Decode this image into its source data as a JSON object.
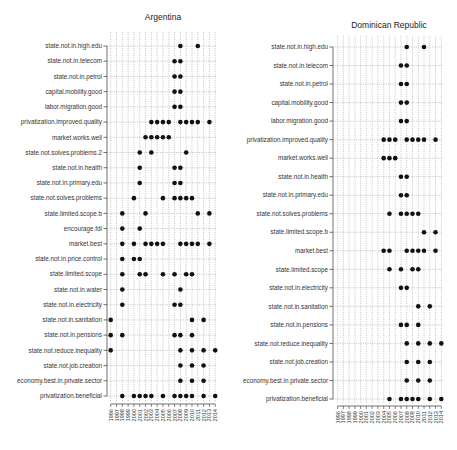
{
  "chart_data": [
    {
      "type": "scatter",
      "title": "Argentina",
      "xlabel": "",
      "ylabel": "",
      "x_ticks": [
        "1996",
        "1997",
        "1998",
        "1999",
        "2000",
        "2001",
        "2002",
        "2003",
        "2004",
        "2005",
        "2006",
        "2007",
        "2008",
        "2009",
        "2010",
        "2011",
        "2012",
        "2013",
        "2014"
      ],
      "xlim": [
        1996,
        2014
      ],
      "grid": true,
      "rows": [
        {
          "label": "state.not.in.high.edu",
          "years": [
            2008,
            2011
          ]
        },
        {
          "label": "state.not.in.telecom",
          "years": [
            2007,
            2008
          ]
        },
        {
          "label": "state.not.in.petrol",
          "years": [
            2007,
            2008
          ]
        },
        {
          "label": "capital.mobility.good",
          "years": [
            2007,
            2008
          ]
        },
        {
          "label": "labor.migration.good",
          "years": [
            2007,
            2008
          ]
        },
        {
          "label": "privatization.improved.quality",
          "years": [
            2003,
            2004,
            2005,
            2006,
            2008,
            2009,
            2010,
            2011,
            2013
          ]
        },
        {
          "label": "market.works.well",
          "years": [
            2002,
            2003,
            2004,
            2005,
            2006
          ]
        },
        {
          "label": "state.not.solves.problems.2",
          "years": [
            2001,
            2003,
            2009
          ]
        },
        {
          "label": "state.not.in.health",
          "years": [
            2001,
            2007,
            2008
          ]
        },
        {
          "label": "state.not.in.primary.edu",
          "years": [
            2001,
            2007,
            2008
          ]
        },
        {
          "label": "state.not.solves.problems",
          "years": [
            2000,
            2005,
            2007,
            2008,
            2009,
            2010
          ]
        },
        {
          "label": "state.limited.scope.b",
          "years": [
            1998,
            2002,
            2011,
            2013
          ]
        },
        {
          "label": "encourage.fdi",
          "years": [
            1998,
            2001
          ]
        },
        {
          "label": "market.best",
          "years": [
            1998,
            2000,
            2002,
            2003,
            2004,
            2005,
            2008,
            2009,
            2010,
            2011,
            2013
          ]
        },
        {
          "label": "state.not.in.price.control",
          "years": [
            1998,
            2000,
            2001
          ]
        },
        {
          "label": "state.limited.scope",
          "years": [
            1998,
            2001,
            2002,
            2005,
            2007,
            2009,
            2010
          ]
        },
        {
          "label": "state.not.in.water",
          "years": [
            1998,
            2008
          ]
        },
        {
          "label": "state.not.in.electricity",
          "years": [
            1998,
            2007,
            2008
          ]
        },
        {
          "label": "state.not.in.sanitation",
          "years": [
            1996,
            2010,
            2012
          ]
        },
        {
          "label": "state.not.in.pensions",
          "years": [
            1996,
            1998,
            2007,
            2008,
            2010
          ]
        },
        {
          "label": "state.not.reduce.inequality",
          "years": [
            1996,
            2008,
            2010,
            2012,
            2014
          ]
        },
        {
          "label": "state.not.job.creation",
          "years": [
            2008,
            2010,
            2012
          ]
        },
        {
          "label": "economy.best.in.private.sector",
          "years": [
            2008,
            2010,
            2012
          ]
        },
        {
          "label": "privatization.beneficial",
          "years": [
            1998,
            2000,
            2001,
            2002,
            2003,
            2005,
            2007,
            2008,
            2009,
            2010,
            2012,
            2014
          ]
        }
      ]
    },
    {
      "type": "scatter",
      "title": "Dominican Republic",
      "xlabel": "",
      "ylabel": "",
      "x_ticks": [
        "1996",
        "1997",
        "1998",
        "1999",
        "2000",
        "2001",
        "2002",
        "2003",
        "2004",
        "2005",
        "2006",
        "2007",
        "2008",
        "2009",
        "2010",
        "2011",
        "2012",
        "2013",
        "2014"
      ],
      "xlim": [
        1996,
        2014
      ],
      "grid": true,
      "rows": [
        {
          "label": "state.not.in.high.edu",
          "years": [
            2008,
            2011
          ]
        },
        {
          "label": "state.not.in.telecom",
          "years": [
            2007,
            2008
          ]
        },
        {
          "label": "state.not.in.petrol",
          "years": [
            2007,
            2008
          ]
        },
        {
          "label": "capital.mobility.good",
          "years": [
            2007,
            2008
          ]
        },
        {
          "label": "labor.migration.good",
          "years": [
            2007,
            2008
          ]
        },
        {
          "label": "privatization.improved.quality",
          "years": [
            2004,
            2005,
            2006,
            2008,
            2009,
            2010,
            2011,
            2013
          ]
        },
        {
          "label": "market.works.well",
          "years": [
            2004,
            2005,
            2006
          ]
        },
        {
          "label": "state.not.in.health",
          "years": [
            2007,
            2008
          ]
        },
        {
          "label": "state.not.in.primary.edu",
          "years": [
            2007,
            2008
          ]
        },
        {
          "label": "state.not.solves.problems",
          "years": [
            2005,
            2007,
            2008,
            2009,
            2010
          ]
        },
        {
          "label": "state.limited.scope.b",
          "years": [
            2011,
            2013
          ]
        },
        {
          "label": "market.best",
          "years": [
            2004,
            2005,
            2008,
            2009,
            2010,
            2011,
            2013
          ]
        },
        {
          "label": "state.limited.scope",
          "years": [
            2005,
            2007,
            2009,
            2010
          ]
        },
        {
          "label": "state.not.in.electricity",
          "years": [
            2007,
            2008
          ]
        },
        {
          "label": "state.not.in.sanitation",
          "years": [
            2010,
            2012
          ]
        },
        {
          "label": "state.not.in.pensions",
          "years": [
            2007,
            2008,
            2010
          ]
        },
        {
          "label": "state.not.reduce.inequality",
          "years": [
            2008,
            2010,
            2012,
            2014
          ]
        },
        {
          "label": "state.not.job.creation",
          "years": [
            2008,
            2010,
            2012
          ]
        },
        {
          "label": "economy.best.in.private.sector",
          "years": [
            2008,
            2010,
            2012
          ]
        },
        {
          "label": "privatization.beneficial",
          "years": [
            2005,
            2007,
            2008,
            2009,
            2010,
            2012,
            2014
          ]
        }
      ]
    }
  ],
  "style": {
    "dot_color": "#111111",
    "grid_color": "#9a9a9a",
    "axis_color": "#333333"
  }
}
